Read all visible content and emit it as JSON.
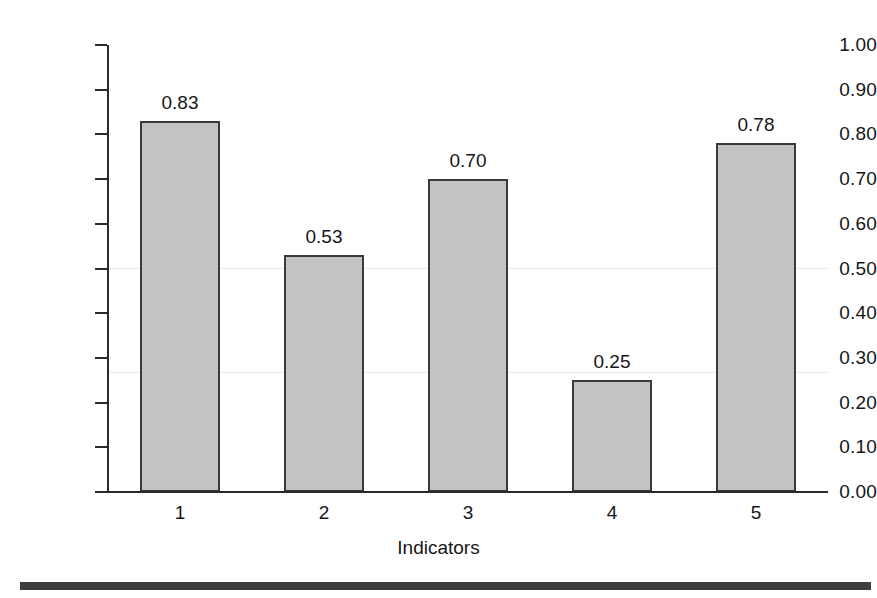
{
  "chart_data": {
    "type": "bar",
    "title": "",
    "subtitle": "",
    "xlabel": "Indicators",
    "ylabel": "",
    "categories": [
      "1",
      "2",
      "3",
      "4",
      "5"
    ],
    "values": [
      0.83,
      0.53,
      0.7,
      0.25,
      0.78
    ],
    "value_labels": [
      "0.83",
      "0.53",
      "0.70",
      "0.25",
      "0.78"
    ],
    "ylim": [
      0.0,
      1.0
    ],
    "ytick_values": [
      0.0,
      0.1,
      0.2,
      0.3,
      0.4,
      0.5,
      0.6,
      0.7,
      0.8,
      0.9,
      1.0
    ],
    "ytick_labels": [
      "0.00",
      "0.10",
      "0.20",
      "0.30",
      "0.40",
      "0.50",
      "0.60",
      "0.70",
      "0.80",
      "0.90",
      "1.00"
    ],
    "grid": false,
    "legend": null,
    "legend_position": "none",
    "bar_fill_color": "#c3c3c3",
    "bar_border_color": "#3a3a3a",
    "axis_color": "#2b2b2b",
    "text_color": "#161616",
    "background_color": "#ffffff",
    "rule_color": "#3d3d3d"
  }
}
